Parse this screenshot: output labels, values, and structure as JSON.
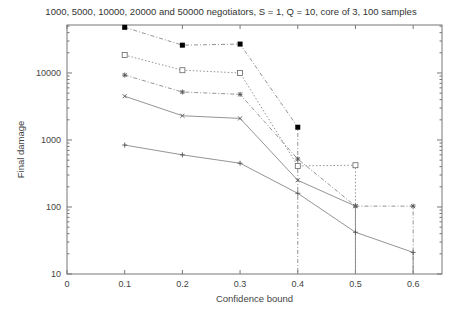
{
  "chart_data": {
    "type": "line",
    "title": "1000, 5000, 10000, 20000 and 50000 negotiators, S = 1, Q = 10, core of 3, 100 samples",
    "xlabel": "Confidence bound",
    "ylabel": "Final damage",
    "xlim": [
      0,
      0.65
    ],
    "ylim": [
      10,
      52000
    ],
    "yscale": "log",
    "grid": false,
    "legend": "none",
    "x_ticks": [
      "0",
      "0.1",
      "0.2",
      "0.3",
      "0.4",
      "0.5",
      "0.6"
    ],
    "y_ticks": [
      "10",
      "100",
      "1000",
      "10000"
    ],
    "series": [
      {
        "name": "50000 negotiators",
        "marker": "filled-square",
        "style": "dash-dot",
        "x": [
          0.1,
          0.2,
          0.3,
          0.4
        ],
        "values": [
          48000,
          26000,
          27000,
          1550
        ]
      },
      {
        "name": "20000 negotiators",
        "marker": "open-square",
        "style": "dotted",
        "x": [
          0.1,
          0.2,
          0.3,
          0.4,
          0.5
        ],
        "values": [
          18500,
          11000,
          10000,
          410,
          420
        ]
      },
      {
        "name": "10000 negotiators",
        "marker": "star",
        "style": "dash-dot",
        "x": [
          0.1,
          0.2,
          0.3,
          0.4,
          0.5,
          0.6
        ],
        "values": [
          9300,
          5200,
          4800,
          520,
          103,
          103
        ]
      },
      {
        "name": "5000 negotiators",
        "marker": "x",
        "style": "solid",
        "x": [
          0.1,
          0.2,
          0.3,
          0.4,
          0.5
        ],
        "values": [
          4500,
          2300,
          2100,
          250,
          103
        ]
      },
      {
        "name": "1000 negotiators",
        "marker": "plus",
        "style": "solid",
        "x": [
          0.1,
          0.2,
          0.3,
          0.4,
          0.5,
          0.6
        ],
        "values": [
          840,
          600,
          450,
          160,
          42,
          21
        ]
      }
    ]
  }
}
